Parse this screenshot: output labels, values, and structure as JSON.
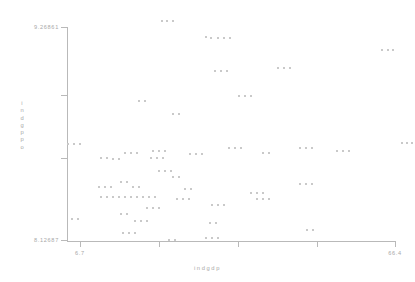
{
  "chart_data": {
    "type": "scatter",
    "title": "",
    "xlabel": "indgdp",
    "ylabel": "indgppo",
    "xlim": [
      6.7,
      66.4
    ],
    "ylim": [
      8.12687,
      9.26861
    ],
    "grid": false,
    "legend": null,
    "xticks": [
      {
        "value": 6.7,
        "label": "6.7",
        "px": 80
      },
      {
        "value": 21.6,
        "label": "",
        "px": 159
      },
      {
        "value": 36.6,
        "label": "",
        "px": 238
      },
      {
        "value": 51.5,
        "label": "",
        "px": 317
      },
      {
        "value": 66.4,
        "label": "66.4",
        "px": 395
      }
    ],
    "yticks": [
      {
        "value": 9.26861,
        "label": "9.26861",
        "px": 27
      },
      {
        "value": 8.98676,
        "label": "",
        "px": 95
      },
      {
        "value": 8.72544,
        "label": "",
        "px": 158
      },
      {
        "value": 8.12687,
        "label": "8.12687",
        "px": 240
      }
    ],
    "marker_color": "#c9c9c9",
    "axis_color": "#b9b9b9",
    "text_color": "#a8a8a8",
    "points": [
      [
        161,
        20
      ],
      [
        166,
        20
      ],
      [
        172,
        20
      ],
      [
        205,
        36
      ],
      [
        210,
        37
      ],
      [
        217,
        37
      ],
      [
        223,
        37
      ],
      [
        229,
        37
      ],
      [
        381,
        49
      ],
      [
        387,
        49
      ],
      [
        392,
        49
      ],
      [
        214,
        70
      ],
      [
        220,
        70
      ],
      [
        226,
        70
      ],
      [
        277,
        67
      ],
      [
        283,
        67
      ],
      [
        289,
        67
      ],
      [
        138,
        100
      ],
      [
        144,
        100
      ],
      [
        238,
        95
      ],
      [
        244,
        95
      ],
      [
        250,
        95
      ],
      [
        172,
        113
      ],
      [
        178,
        113
      ],
      [
        67,
        143
      ],
      [
        73,
        143
      ],
      [
        79,
        143
      ],
      [
        299,
        147
      ],
      [
        305,
        147
      ],
      [
        311,
        147
      ],
      [
        100,
        157
      ],
      [
        106,
        157
      ],
      [
        112,
        158
      ],
      [
        118,
        158
      ],
      [
        124,
        152
      ],
      [
        130,
        152
      ],
      [
        136,
        152
      ],
      [
        152,
        150
      ],
      [
        158,
        150
      ],
      [
        164,
        150
      ],
      [
        150,
        157
      ],
      [
        156,
        157
      ],
      [
        162,
        157
      ],
      [
        189,
        153
      ],
      [
        195,
        153
      ],
      [
        201,
        153
      ],
      [
        228,
        147
      ],
      [
        234,
        147
      ],
      [
        240,
        147
      ],
      [
        262,
        152
      ],
      [
        268,
        152
      ],
      [
        336,
        150
      ],
      [
        342,
        150
      ],
      [
        348,
        150
      ],
      [
        401,
        142
      ],
      [
        406,
        142
      ],
      [
        411,
        142
      ],
      [
        158,
        170
      ],
      [
        164,
        170
      ],
      [
        170,
        170
      ],
      [
        172,
        176
      ],
      [
        178,
        176
      ],
      [
        98,
        186
      ],
      [
        104,
        186
      ],
      [
        110,
        186
      ],
      [
        120,
        181
      ],
      [
        126,
        181
      ],
      [
        132,
        186
      ],
      [
        138,
        186
      ],
      [
        184,
        188
      ],
      [
        190,
        188
      ],
      [
        299,
        183
      ],
      [
        305,
        183
      ],
      [
        311,
        183
      ],
      [
        100,
        196
      ],
      [
        106,
        196
      ],
      [
        112,
        196
      ],
      [
        118,
        196
      ],
      [
        124,
        196
      ],
      [
        130,
        196
      ],
      [
        136,
        196
      ],
      [
        142,
        196
      ],
      [
        148,
        196
      ],
      [
        154,
        196
      ],
      [
        176,
        198
      ],
      [
        182,
        198
      ],
      [
        188,
        198
      ],
      [
        250,
        192
      ],
      [
        256,
        192
      ],
      [
        262,
        192
      ],
      [
        211,
        204
      ],
      [
        217,
        204
      ],
      [
        223,
        204
      ],
      [
        146,
        207
      ],
      [
        152,
        207
      ],
      [
        158,
        207
      ],
      [
        256,
        198
      ],
      [
        262,
        198
      ],
      [
        268,
        198
      ],
      [
        71,
        218
      ],
      [
        77,
        218
      ],
      [
        120,
        213
      ],
      [
        126,
        213
      ],
      [
        134,
        220
      ],
      [
        140,
        220
      ],
      [
        146,
        220
      ],
      [
        209,
        222
      ],
      [
        215,
        222
      ],
      [
        122,
        232
      ],
      [
        128,
        232
      ],
      [
        134,
        232
      ],
      [
        168,
        239
      ],
      [
        174,
        239
      ],
      [
        205,
        237
      ],
      [
        211,
        237
      ],
      [
        217,
        237
      ],
      [
        306,
        229
      ],
      [
        312,
        229
      ]
    ]
  }
}
